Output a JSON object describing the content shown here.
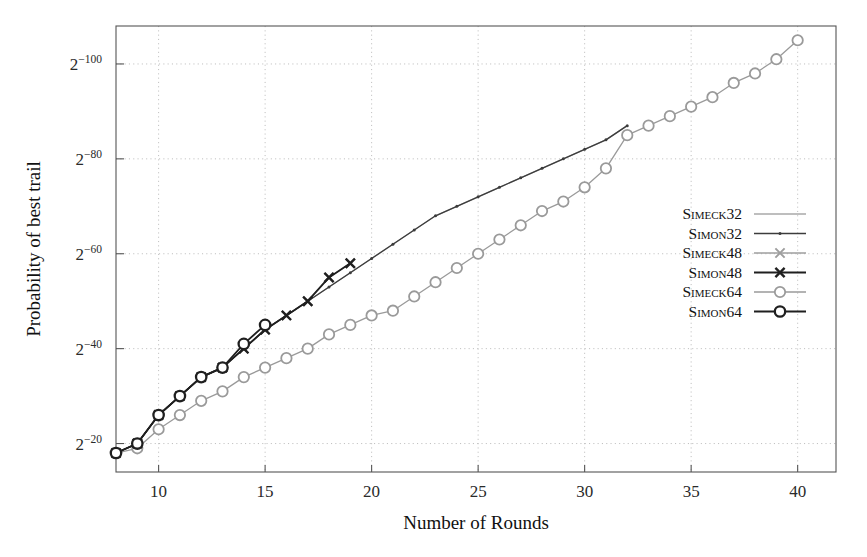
{
  "chart_data": {
    "type": "line",
    "title": "",
    "xlabel": "Number of Rounds",
    "ylabel": "Probability of best trail",
    "xlim": [
      8,
      41.8
    ],
    "ylim": [
      -108,
      -14
    ],
    "yaxis_note": "log2 probability; axis labelled as powers of two, magnitude increasing upward",
    "grid": true,
    "legend_position": "right-middle",
    "xticks": [
      10,
      15,
      20,
      25,
      30,
      35,
      40
    ],
    "xtick_labels": [
      "10",
      "15",
      "20",
      "25",
      "30",
      "35",
      "40"
    ],
    "yticks": [
      -20,
      -40,
      -60,
      -80,
      -100
    ],
    "ytick_labels": [
      "2",
      "2",
      "2",
      "2",
      "2"
    ],
    "ytick_exponents": [
      "−20",
      "−40",
      "−60",
      "−80",
      "−100"
    ],
    "series": [
      {
        "name": "Simeck32",
        "color": "#a8a8a8",
        "marker": "none",
        "linewidth": 1.3,
        "x": [
          8,
          9,
          10,
          11,
          12,
          13,
          14,
          15,
          16,
          17,
          18,
          19,
          20,
          21,
          22,
          23,
          24,
          25,
          26,
          27,
          28,
          29,
          30,
          31,
          32
        ],
        "y": [
          -18,
          -20,
          -26,
          -30,
          -34,
          -36,
          -40,
          -44,
          -47,
          -50,
          -53,
          -56,
          -59,
          -62,
          -65,
          -68,
          -70,
          -72,
          -74,
          -76,
          -78,
          -80,
          -82,
          -84,
          -87
        ]
      },
      {
        "name": "Simon32",
        "color": "#3c3c3c",
        "marker": "dot",
        "linewidth": 1.3,
        "x": [
          8,
          9,
          10,
          11,
          12,
          13,
          14,
          15,
          16,
          17,
          18,
          19,
          20,
          21,
          22,
          23,
          24,
          25,
          26,
          27,
          28,
          29,
          30,
          31,
          32
        ],
        "y": [
          -18,
          -20,
          -26,
          -30,
          -34,
          -36,
          -40,
          -44,
          -47,
          -50,
          -53,
          -56,
          -59,
          -62,
          -65,
          -68,
          -70,
          -72,
          -74,
          -76,
          -78,
          -80,
          -82,
          -84,
          -87
        ]
      },
      {
        "name": "Simeck48",
        "color": "#9e9e9e",
        "marker": "cross",
        "linewidth": 1.3,
        "x": [
          8,
          9,
          10,
          11,
          12,
          13,
          14,
          15,
          16,
          17,
          18,
          19
        ],
        "y": [
          -18,
          -20,
          -26,
          -30,
          -34,
          -36,
          -40,
          -44,
          -47,
          -50,
          -55,
          -58
        ]
      },
      {
        "name": "Simon48",
        "color": "#1f1f1f",
        "marker": "cross",
        "linewidth": 1.8,
        "x": [
          8,
          9,
          10,
          11,
          12,
          13,
          14,
          15,
          16,
          17,
          18,
          19
        ],
        "y": [
          -18,
          -20,
          -26,
          -30,
          -34,
          -36,
          -40,
          -44,
          -47,
          -50,
          -55,
          -58
        ]
      },
      {
        "name": "Simeck64",
        "color": "#9a9a9a",
        "marker": "circle",
        "linewidth": 1.3,
        "x": [
          8,
          9,
          10,
          11,
          12,
          13,
          14,
          15,
          16,
          17,
          18,
          19,
          20,
          21,
          22,
          23,
          24,
          25,
          26,
          27,
          28,
          29,
          30,
          31,
          32,
          33,
          34,
          35,
          36,
          37,
          38,
          39,
          40
        ],
        "y": [
          -18,
          -19,
          -23,
          -26,
          -29,
          -31,
          -34,
          -36,
          -38,
          -40,
          -43,
          -45,
          -47,
          -48,
          -51,
          -54,
          -57,
          -60,
          -63,
          -66,
          -69,
          -71,
          -74,
          -78,
          -85,
          -87,
          -89,
          -91,
          -93,
          -96,
          -98,
          -101,
          -105
        ]
      },
      {
        "name": "Simon64",
        "color": "#1f1f1f",
        "marker": "circle",
        "linewidth": 1.8,
        "x": [
          8,
          9,
          10,
          11,
          12,
          13,
          14,
          15
        ],
        "y": [
          -18,
          -20,
          -26,
          -30,
          -34,
          -36,
          -41,
          -45
        ]
      }
    ]
  },
  "legend": {
    "entries": [
      {
        "label": "Simeck32"
      },
      {
        "label": "Simon32"
      },
      {
        "label": "Simeck48"
      },
      {
        "label": "Simon48"
      },
      {
        "label": "Simeck64"
      },
      {
        "label": "Simon64"
      }
    ]
  }
}
